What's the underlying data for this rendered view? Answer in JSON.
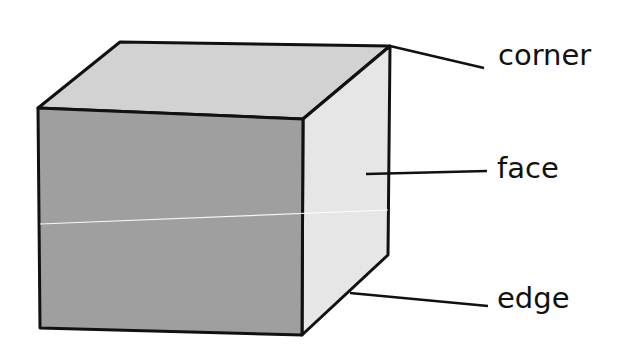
{
  "diagram": {
    "labels": [
      {
        "id": "corner",
        "text": "corner",
        "x": 498,
        "y": 43,
        "leader": {
          "x1": 390,
          "y1": 46,
          "x2": 484,
          "y2": 68
        }
      },
      {
        "id": "face",
        "text": "face",
        "x": 497,
        "y": 156,
        "leader": {
          "x1": 366,
          "y1": 174,
          "x2": 487,
          "y2": 171
        }
      },
      {
        "id": "edge",
        "text": "edge",
        "x": 497,
        "y": 284,
        "leader": {
          "x1": 350,
          "y1": 293,
          "x2": 488,
          "y2": 306
        }
      }
    ],
    "colors": {
      "front_face": "#9f9f9f",
      "top_face": "#d2d2d2",
      "side_face": "#e6e6e6",
      "outline": "#111111",
      "text": "#111111",
      "background": "#ffffff"
    }
  }
}
